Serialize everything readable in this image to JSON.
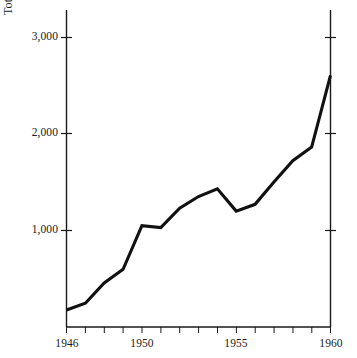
{
  "chart_data": {
    "type": "line",
    "title": "",
    "subtitle": "",
    "xlabel": "",
    "ylabel_plain": "Total annual pages of articles in Progress of Theoretical Physics",
    "ylabel_prefix": "Total annual pages of articles in ",
    "ylabel_journal_italic": "Progress of Theoretical Physics",
    "x": [
      1946,
      1947,
      1948,
      1949,
      1950,
      1951,
      1952,
      1953,
      1954,
      1955,
      1956,
      1957,
      1958,
      1959,
      1960
    ],
    "values": [
      180,
      250,
      460,
      600,
      1050,
      1030,
      1230,
      1350,
      1430,
      1200,
      1270,
      1500,
      1720,
      1860,
      2600
    ],
    "series": [
      {
        "name": "Total annual pages",
        "values": [
          180,
          250,
          460,
          600,
          1050,
          1030,
          1230,
          1350,
          1430,
          1200,
          1270,
          1500,
          1720,
          1860,
          2600
        ],
        "color": "#111111"
      }
    ],
    "xlim": [
      1946,
      1960
    ],
    "ylim": [
      0,
      3200
    ],
    "ytick_values": [
      1000,
      2000,
      3000
    ],
    "ytick_labels": [
      "1,000",
      "2,000",
      "3,000"
    ],
    "xtick_values": [
      1946,
      1947,
      1948,
      1949,
      1950,
      1951,
      1952,
      1953,
      1954,
      1955,
      1956,
      1957,
      1958,
      1959,
      1960
    ],
    "xtick_labels_shown": [
      "1946",
      "1950",
      "1955",
      "1960"
    ],
    "xtick_labeled_values": [
      1946,
      1950,
      1955,
      1960
    ],
    "grid": false,
    "legend": false,
    "legend_position": "none",
    "annotations": [],
    "line_color": "#111111",
    "background_color": "#ffffff",
    "axis_color": "#1a1a1a",
    "left_axis": true,
    "right_axis": true,
    "bottom_axis": true,
    "top_axis": false
  }
}
